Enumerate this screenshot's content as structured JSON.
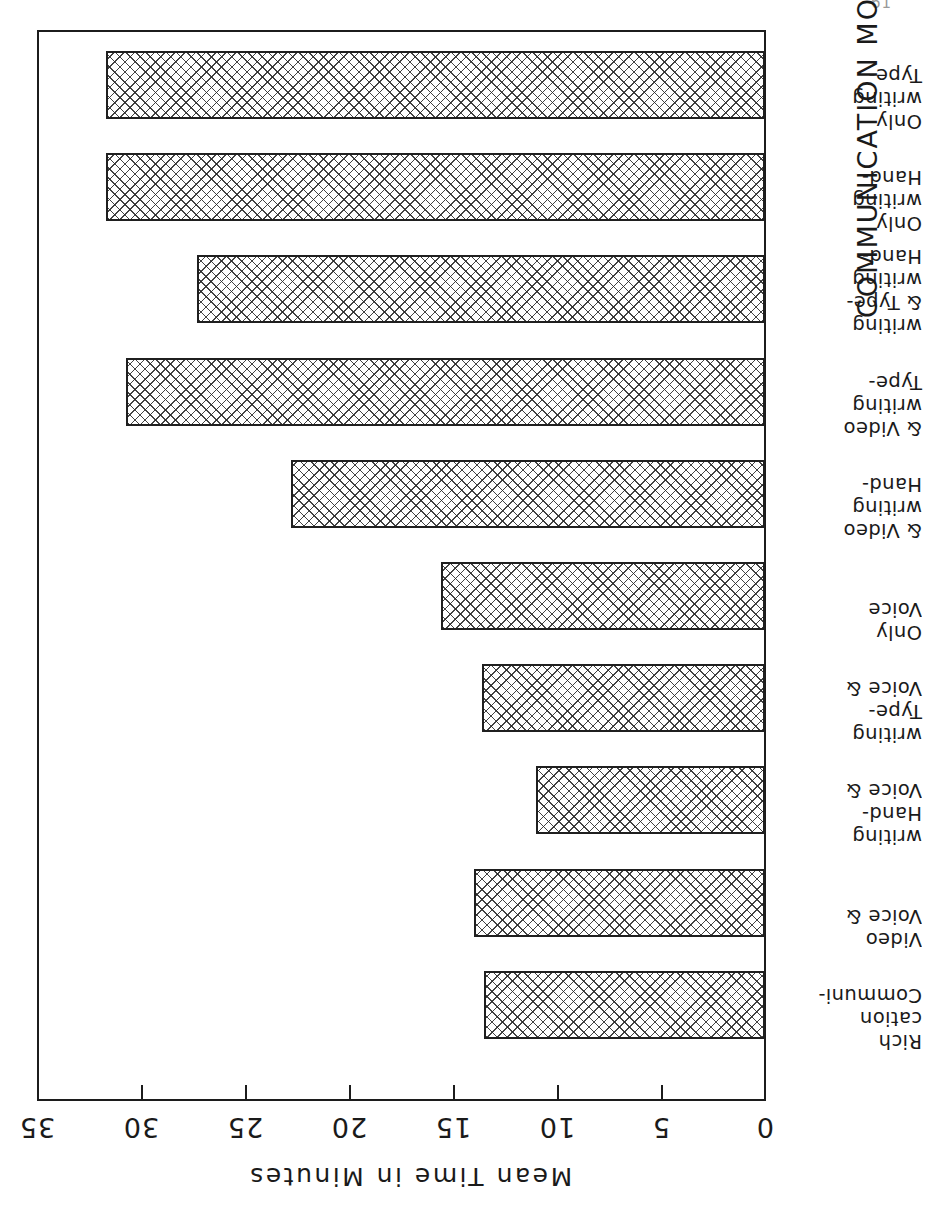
{
  "page": {
    "page_number": "61"
  },
  "chart_data": {
    "type": "bar",
    "orientation": "horizontal",
    "title": "",
    "xlabel": "Mean Time in Minutes",
    "ylabel": "COMMUNICATION MODES",
    "xlim": [
      0,
      35
    ],
    "grid": false,
    "legend": null,
    "tick_labels": [
      "0",
      "5",
      "10",
      "15",
      "20",
      "25",
      "30",
      "35"
    ],
    "ticks": [
      0,
      5,
      10,
      15,
      20,
      25,
      30,
      35
    ],
    "categories": [
      "Communication Rich",
      "Voice & Video",
      "Voice & Handwriting",
      "Voice & Typewriting",
      "Voice Only",
      "Handwriting & Video",
      "Typewriting & Video",
      "Handwriting & Typewriting",
      "Handwriting Only",
      "Typewriting Only"
    ],
    "category_label_lines": [
      [
        "Communi-",
        "cation",
        "Rich"
      ],
      [
        "Voice &",
        "Video"
      ],
      [
        "Voice &",
        "Hand-",
        "writing"
      ],
      [
        "Voice &",
        "Type-",
        "writing"
      ],
      [
        "Voice",
        "Only"
      ],
      [
        "Hand-",
        "writing",
        "& Video"
      ],
      [
        "Type-",
        "writing",
        "& Video"
      ],
      [
        "Hand-",
        "writing",
        "& Type-",
        "writing"
      ],
      [
        "Hand-",
        "writing",
        "Only"
      ],
      [
        "Type-",
        "writing",
        "Only"
      ]
    ],
    "values": [
      13.5,
      14.0,
      11.0,
      13.6,
      15.6,
      22.8,
      30.7,
      27.3,
      31.7,
      31.7
    ],
    "bar_fill": "cross-hatch",
    "bar_edge_color": "#1f1f1f",
    "axis_color": "#1c1c1c"
  },
  "value_axis_title": "Mean Time in Minutes",
  "category_axis_title": "COMMUNICATION MODES"
}
